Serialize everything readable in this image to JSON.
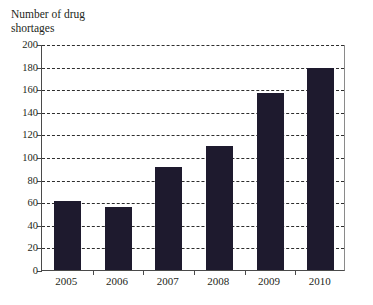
{
  "chart_data": {
    "type": "bar",
    "title": "Number of drug\nshortages",
    "title_line1": "Number of drug",
    "title_line2": "shortages",
    "xlabel": "",
    "ylabel": "Number of drug shortages",
    "categories": [
      "2005",
      "2006",
      "2007",
      "2008",
      "2009",
      "2010"
    ],
    "values": [
      61,
      56,
      91,
      110,
      157,
      179
    ],
    "ylim": [
      0,
      200
    ],
    "ytick_values": [
      0,
      20,
      40,
      60,
      80,
      100,
      120,
      140,
      160,
      180,
      200
    ],
    "ytick_labels": [
      "0",
      "20",
      "40",
      "60",
      "80",
      "100",
      "120",
      "140",
      "160",
      "180",
      "200"
    ],
    "grid": "horizontal-dashed",
    "legend": "none",
    "bar_color": "#1e1a2e",
    "plot_background": "#ffffff",
    "axis_color": "#4a4a4a",
    "gridline_color": "#2e2e2e"
  }
}
